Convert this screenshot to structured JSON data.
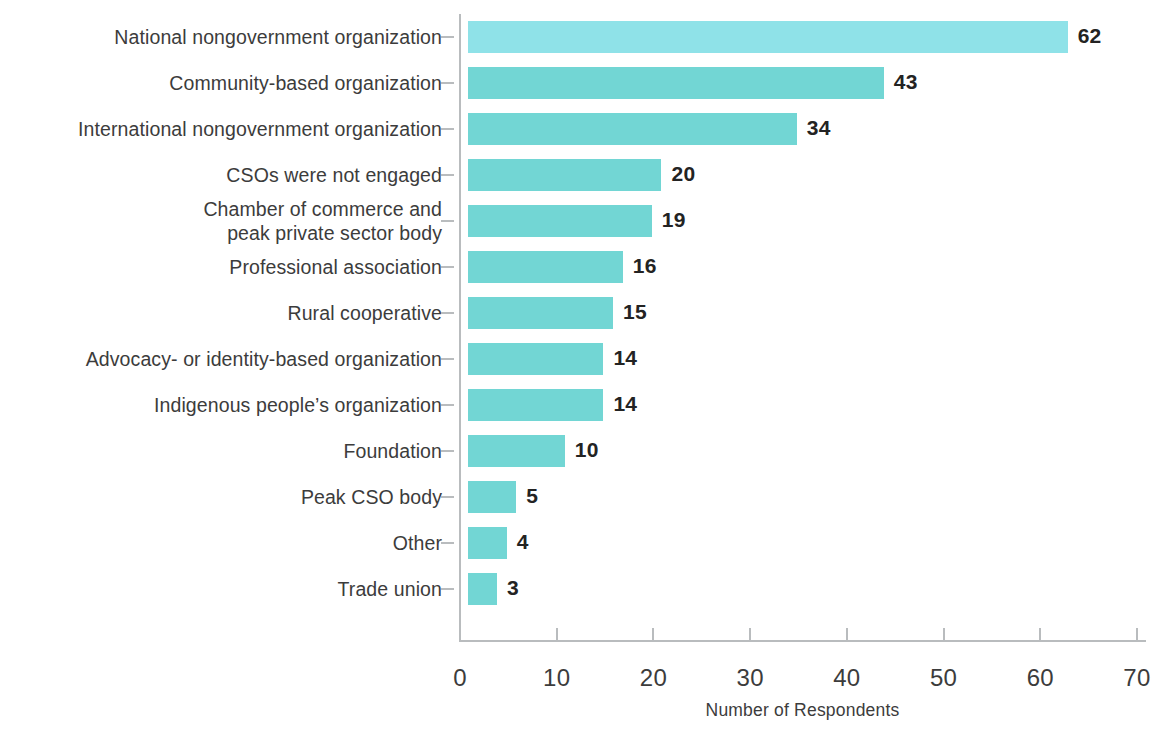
{
  "chart_data": {
    "type": "bar",
    "orientation": "horizontal",
    "title": "",
    "xlabel": "Number of Respondents",
    "ylabel": "",
    "xlim": [
      0,
      70
    ],
    "xticks": [
      0,
      10,
      20,
      30,
      40,
      50,
      60,
      70
    ],
    "grid": false,
    "legend": null,
    "categories": [
      "National nongovernment organization",
      "Community-based organization",
      "International nongovernment organization",
      "CSOs were not engaged",
      "Chamber of commerce and\npeak private sector body",
      "Professional association",
      "Rural cooperative",
      "Advocacy- or identity-based organization",
      "Indigenous people’s organization",
      "Foundation",
      "Peak CSO body",
      "Other",
      "Trade union"
    ],
    "values": [
      62,
      43,
      34,
      20,
      19,
      16,
      15,
      14,
      14,
      10,
      5,
      4,
      3
    ],
    "value_labels": [
      "62",
      "43",
      "34",
      "20",
      "19",
      "16",
      "15",
      "14",
      "14",
      "10",
      "5",
      "4",
      "3"
    ],
    "bar_colors": [
      "#8fe2e8",
      "#72d6d4",
      "#72d6d4",
      "#72d6d4",
      "#72d6d4",
      "#72d6d4",
      "#72d6d4",
      "#72d6d4",
      "#72d6d4",
      "#72d6d4",
      "#72d6d4",
      "#72d6d4",
      "#72d6d4"
    ],
    "accent_color": "#72d6d4",
    "highlight_color": "#8fe2e8",
    "axis_color": "#b9bcbe",
    "text_color": "#3c3c3c"
  }
}
